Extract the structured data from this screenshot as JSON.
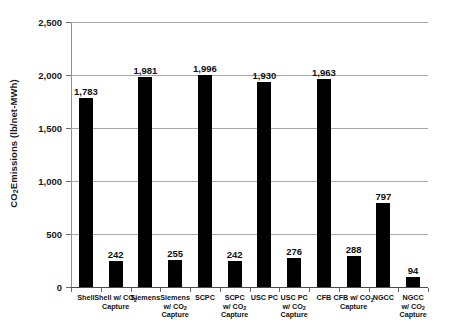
{
  "chart_data": {
    "type": "bar",
    "title": "",
    "xlabel": "",
    "ylabel": "CO2 Emissions (lb/net-MWh)",
    "ylabel_parts": {
      "pre": "CO",
      "sub": "2",
      "post": " Emissions (lb/net-MWh)"
    },
    "ylim": [
      0,
      2500
    ],
    "yticks": [
      0,
      500,
      1000,
      1500,
      2000,
      2500
    ],
    "ytick_labels": [
      "0",
      "500",
      "1,000",
      "1,500",
      "2,000",
      "2,500"
    ],
    "grid": true,
    "legend": "none",
    "bar_color": "#000000",
    "gridline_color": "#a8a8a8",
    "categories": [
      "Shell",
      "Shell w/ CO2 Capture",
      "Siemens",
      "Siemens w/ CO2 Capture",
      "SCPC",
      "SCPC w/ CO2 Capture",
      "USC PC",
      "USC PC w/ CO2 Capture",
      "CFB",
      "CFB w/ CO2 Capture",
      "NGCC",
      "NGCC w/ CO2 Capture"
    ],
    "category_parts": [
      {
        "l1": "Shell",
        "l2": "",
        "l2sub": "",
        "l2post": "",
        "l3": ""
      },
      {
        "l1": "Shell w/ CO",
        "l1sub": "2",
        "l1post": "",
        "l2": "Capture"
      },
      {
        "l1": "Siemens"
      },
      {
        "l1": "Siemens",
        "l2": "w/ CO",
        "l2sub": "2",
        "l3": "Capture"
      },
      {
        "l1": "SCPC"
      },
      {
        "l1": "SCPC",
        "l2": "w/ CO",
        "l2sub": "2",
        "l3": "Capture"
      },
      {
        "l1": "USC PC"
      },
      {
        "l1": "USC PC",
        "l2": "w/ CO",
        "l2sub": "2",
        "l3": "Capture"
      },
      {
        "l1": "CFB"
      },
      {
        "l1": "CFB w/ CO",
        "l1sub": "2",
        "l2": "Capture"
      },
      {
        "l1": "NGCC"
      },
      {
        "l1": "NGCC",
        "l2": "w/ CO",
        "l2sub": "2",
        "l3": "Capture"
      }
    ],
    "values": [
      1783,
      242,
      1981,
      255,
      1996,
      242,
      1930,
      276,
      1963,
      288,
      797,
      94
    ],
    "value_labels": [
      "1,783",
      "242",
      "1,981",
      "255",
      "1,996",
      "242",
      "1,930",
      "276",
      "1,963",
      "288",
      "797",
      "94"
    ]
  }
}
